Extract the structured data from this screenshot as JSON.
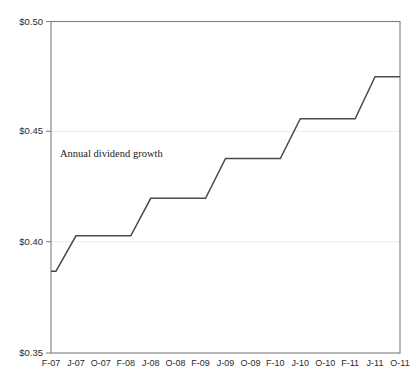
{
  "chart_data": {
    "type": "line",
    "title": "",
    "subtitle": "",
    "xlabel": "",
    "ylabel": "",
    "annotation": "Annual dividend growth",
    "grid": true,
    "legend_position": "none",
    "line_color": "#4a4a4a",
    "frame_color": "#7d7d7d",
    "grid_color": "#ededed",
    "background_color": "#ffffff",
    "ylim": [
      0.35,
      0.5
    ],
    "yticks": [
      0.35,
      0.4,
      0.45,
      0.5
    ],
    "ytick_labels": [
      "$0.35",
      "$0.40",
      "$0.45",
      "$0.50"
    ],
    "categories": [
      "F-07",
      "J-07",
      "O-07",
      "F-08",
      "J-08",
      "O-08",
      "F-09",
      "J-09",
      "O-09",
      "F-10",
      "J-10",
      "O-10",
      "F-11",
      "J-11",
      "O-11"
    ],
    "x": [
      "F-07",
      "J-07",
      "O-07",
      "F-08",
      "J-08",
      "O-08",
      "F-09",
      "J-09",
      "O-09",
      "F-10",
      "J-10",
      "O-10",
      "F-11",
      "J-11",
      "O-11"
    ],
    "values": [
      0.387,
      0.403,
      0.403,
      0.403,
      0.42,
      0.42,
      0.42,
      0.438,
      0.438,
      0.438,
      0.456,
      0.456,
      0.456,
      0.475,
      0.475
    ],
    "series": [
      {
        "name": "Annual dividend growth",
        "values": [
          0.387,
          0.403,
          0.403,
          0.403,
          0.42,
          0.42,
          0.42,
          0.438,
          0.438,
          0.438,
          0.456,
          0.456,
          0.456,
          0.475,
          0.475
        ]
      }
    ],
    "step_levels": [
      0.387,
      0.403,
      0.42,
      0.438,
      0.456,
      0.475
    ]
  },
  "axes": {
    "y_tick_labels": [
      "$0.50",
      "$0.45",
      "$0.40",
      "$0.35"
    ],
    "x_tick_labels": [
      "F-07",
      "J-07",
      "O-07",
      "F-08",
      "J-08",
      "O-08",
      "F-09",
      "J-09",
      "O-09",
      "F-10",
      "J-10",
      "O-10",
      "F-11",
      "J-11",
      "O-11"
    ]
  },
  "annotation": {
    "label": "Annual dividend growth"
  }
}
